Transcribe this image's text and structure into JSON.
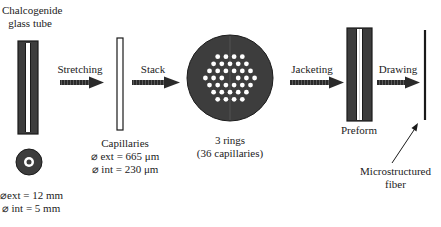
{
  "diagram": {
    "colors": {
      "glass": "#3d3d3d",
      "outline": "#1a1a1a",
      "hole": "#ffffff",
      "text": "#222222"
    },
    "steps": [
      {
        "id": "tube",
        "label_line1": "Chalcogenide",
        "label_line2": "glass tube",
        "dim_ext": "⌀ext = 12 mm",
        "dim_int": "⌀ int = 5 mm"
      },
      {
        "id": "stretching",
        "label": "Stretching"
      },
      {
        "id": "capillaries",
        "label": "Capillaries",
        "dim_ext": "⌀ ext = 665 μm",
        "dim_int": "⌀ int = 230 μm"
      },
      {
        "id": "stack",
        "label": "Stack"
      },
      {
        "id": "bundle",
        "label_line1": "3 rings",
        "label_line2": "(36 capillaries)",
        "rings": 3,
        "capillaries": 36
      },
      {
        "id": "jacketing",
        "label": "Jacketing"
      },
      {
        "id": "preform",
        "label": "Preform"
      },
      {
        "id": "drawing",
        "label": "Drawing"
      },
      {
        "id": "fiber",
        "label_line1": "Microstructured",
        "label_line2": "fiber"
      }
    ]
  }
}
